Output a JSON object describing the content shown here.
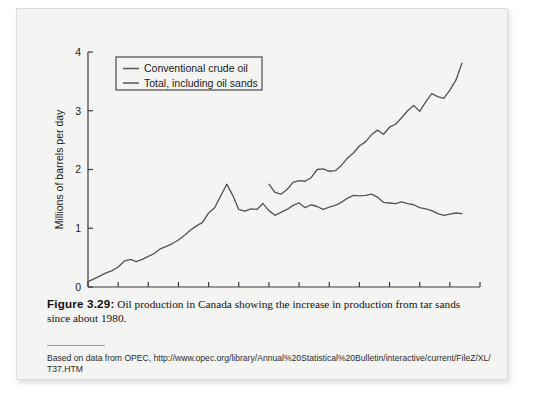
{
  "figure": {
    "number_label": "Figure 3.29:",
    "caption_text": " Oil production in Canada showing the increase in production from tar sands since about 1980.",
    "source_line1": "Based on data from OPEC, http://www.opec.org/library/Annual%20Statistical%20Bulletin/interactive",
    "source_line2": "/current/FileZ/XL/T37.HTM"
  },
  "chart_data": {
    "type": "line",
    "title": "",
    "xlabel": "",
    "ylabel": "Millions of barrels per day",
    "xlim": [
      1950,
      2015
    ],
    "ylim": [
      0,
      4
    ],
    "xticks": [
      1950,
      1955,
      1960,
      1965,
      1970,
      1975,
      1980,
      1985,
      1990,
      1995,
      2000,
      2005,
      2010,
      2015
    ],
    "yticks": [
      0,
      1,
      2,
      3,
      4
    ],
    "grid": false,
    "legend_position": "top-left",
    "line_color": "#55555a",
    "series": [
      {
        "name": "Conventional crude oil",
        "x": [
          1950,
          1951,
          1952,
          1953,
          1954,
          1955,
          1956,
          1957,
          1958,
          1959,
          1960,
          1961,
          1962,
          1963,
          1964,
          1965,
          1966,
          1967,
          1968,
          1969,
          1970,
          1971,
          1972,
          1973,
          1974,
          1975,
          1976,
          1977,
          1978,
          1979,
          1980,
          1981,
          1982,
          1983,
          1984,
          1985,
          1986,
          1987,
          1988,
          1989,
          1990,
          1991,
          1992,
          1993,
          1994,
          1995,
          1996,
          1997,
          1998,
          1999,
          2000,
          2001,
          2002,
          2003,
          2004,
          2005,
          2006,
          2007,
          2008,
          2009,
          2010,
          2011,
          2012
        ],
        "values": [
          0.09,
          0.14,
          0.19,
          0.24,
          0.28,
          0.34,
          0.44,
          0.47,
          0.43,
          0.47,
          0.52,
          0.57,
          0.65,
          0.69,
          0.74,
          0.8,
          0.88,
          0.97,
          1.04,
          1.1,
          1.26,
          1.35,
          1.55,
          1.75,
          1.56,
          1.32,
          1.29,
          1.33,
          1.32,
          1.42,
          1.3,
          1.22,
          1.27,
          1.32,
          1.39,
          1.43,
          1.35,
          1.4,
          1.37,
          1.32,
          1.36,
          1.39,
          1.44,
          1.51,
          1.56,
          1.55,
          1.56,
          1.58,
          1.53,
          1.44,
          1.43,
          1.42,
          1.45,
          1.42,
          1.4,
          1.35,
          1.33,
          1.3,
          1.25,
          1.22,
          1.24,
          1.26,
          1.25
        ]
      },
      {
        "name": "Total, including oil sands",
        "x": [
          1980,
          1981,
          1982,
          1983,
          1984,
          1985,
          1986,
          1987,
          1988,
          1989,
          1990,
          1991,
          1992,
          1993,
          1994,
          1995,
          1996,
          1997,
          1998,
          1999,
          2000,
          2001,
          2002,
          2003,
          2004,
          2005,
          2006,
          2007,
          2008,
          2009,
          2010,
          2011,
          2012
        ],
        "values": [
          1.75,
          1.61,
          1.58,
          1.66,
          1.78,
          1.81,
          1.8,
          1.86,
          2.0,
          2.01,
          1.97,
          1.98,
          2.07,
          2.19,
          2.28,
          2.4,
          2.47,
          2.59,
          2.67,
          2.6,
          2.72,
          2.77,
          2.88,
          3.0,
          3.09,
          2.99,
          3.15,
          3.29,
          3.24,
          3.21,
          3.35,
          3.52,
          3.81
        ]
      }
    ]
  },
  "legend": {
    "items": [
      {
        "label": "Conventional crude oil"
      },
      {
        "label": "Total, including oil sands"
      }
    ]
  }
}
